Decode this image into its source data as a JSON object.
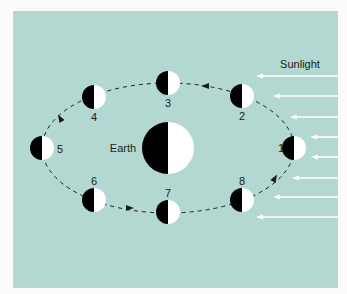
{
  "diagram": {
    "title_label": "Sunlight",
    "earth_label": "Earth",
    "colors": {
      "background": "#b3d8d1",
      "dark": "#000000",
      "light": "#ffffff",
      "orbit": "#1a1a1a",
      "sunlight": "#ffffff"
    },
    "earth": {
      "cx": 168,
      "cy": 148,
      "r": 26
    },
    "moons": [
      {
        "label": "1",
        "cx": 294,
        "cy": 148,
        "lx": 281,
        "ly": 148
      },
      {
        "label": "2",
        "cx": 242,
        "cy": 96,
        "lx": 242,
        "ly": 116
      },
      {
        "label": "3",
        "cx": 168,
        "cy": 83,
        "lx": 168,
        "ly": 103
      },
      {
        "label": "4",
        "cx": 94,
        "cy": 97,
        "lx": 94,
        "ly": 117
      },
      {
        "label": "5",
        "cx": 42,
        "cy": 148,
        "lx": 60,
        "ly": 149
      },
      {
        "label": "6",
        "cx": 94,
        "cy": 200,
        "lx": 94,
        "ly": 181
      },
      {
        "label": "7",
        "cx": 168,
        "cy": 212,
        "lx": 168,
        "ly": 193
      },
      {
        "label": "8",
        "cx": 242,
        "cy": 200,
        "lx": 242,
        "ly": 181
      }
    ],
    "moon_radius": 12,
    "sun_rays_y": [
      76,
      96,
      117,
      137,
      157,
      178,
      197,
      217
    ],
    "sun_rays_x_start": [
      256,
      273,
      290,
      310,
      311,
      292,
      273,
      256
    ],
    "sun_rays_x_end": 338,
    "orbit_direction": "counterclockwise"
  }
}
